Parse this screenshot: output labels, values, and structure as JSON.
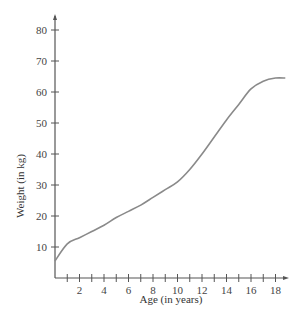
{
  "chart_data": {
    "type": "line",
    "title": "",
    "xlabel": "Age (in years)",
    "ylabel": "Weight (in kg)",
    "xlim": [
      0,
      19
    ],
    "ylim": [
      0,
      85
    ],
    "grid": false,
    "legend": null,
    "x_ticks": [
      1,
      2,
      3,
      4,
      5,
      6,
      7,
      8,
      9,
      10,
      11,
      12,
      13,
      14,
      15,
      16,
      17,
      18
    ],
    "x_tick_labels": [
      "2",
      "4",
      "6",
      "8",
      "10",
      "12",
      "14",
      "16",
      "18"
    ],
    "y_ticks": [
      10,
      20,
      30,
      40,
      50,
      60,
      70,
      80
    ],
    "y_tick_labels": [
      "10",
      "20",
      "30",
      "40",
      "50",
      "60",
      "70",
      "80"
    ],
    "series": [
      {
        "name": "Weight",
        "x": [
          0,
          1,
          2,
          3,
          4,
          5,
          6,
          7,
          8,
          9,
          10,
          11,
          12,
          13,
          14,
          15,
          16,
          17,
          18,
          18.8
        ],
        "values": [
          5.5,
          11,
          13,
          15,
          17,
          19.5,
          21.5,
          23.5,
          26,
          28.5,
          31,
          35,
          40,
          45.5,
          51,
          56,
          61,
          63.5,
          64.5,
          64.5
        ]
      }
    ]
  }
}
